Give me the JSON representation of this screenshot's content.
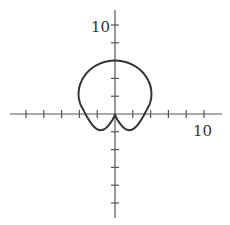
{
  "figure": {
    "type": "polar-curve-plot",
    "x_axis": {
      "range": [
        -12,
        12
      ],
      "tick_step": 2,
      "label_value": "10"
    },
    "y_axis": {
      "range": [
        -12,
        12
      ],
      "tick_step": 2,
      "label_value": "10"
    },
    "curve": {
      "description": "heart-shaped polar curve with cusp at origin",
      "top_y": 6,
      "max_abs_x": 4,
      "min_y": -0.8
    },
    "colors": {
      "axis": "#555555",
      "curve": "#333333"
    }
  }
}
